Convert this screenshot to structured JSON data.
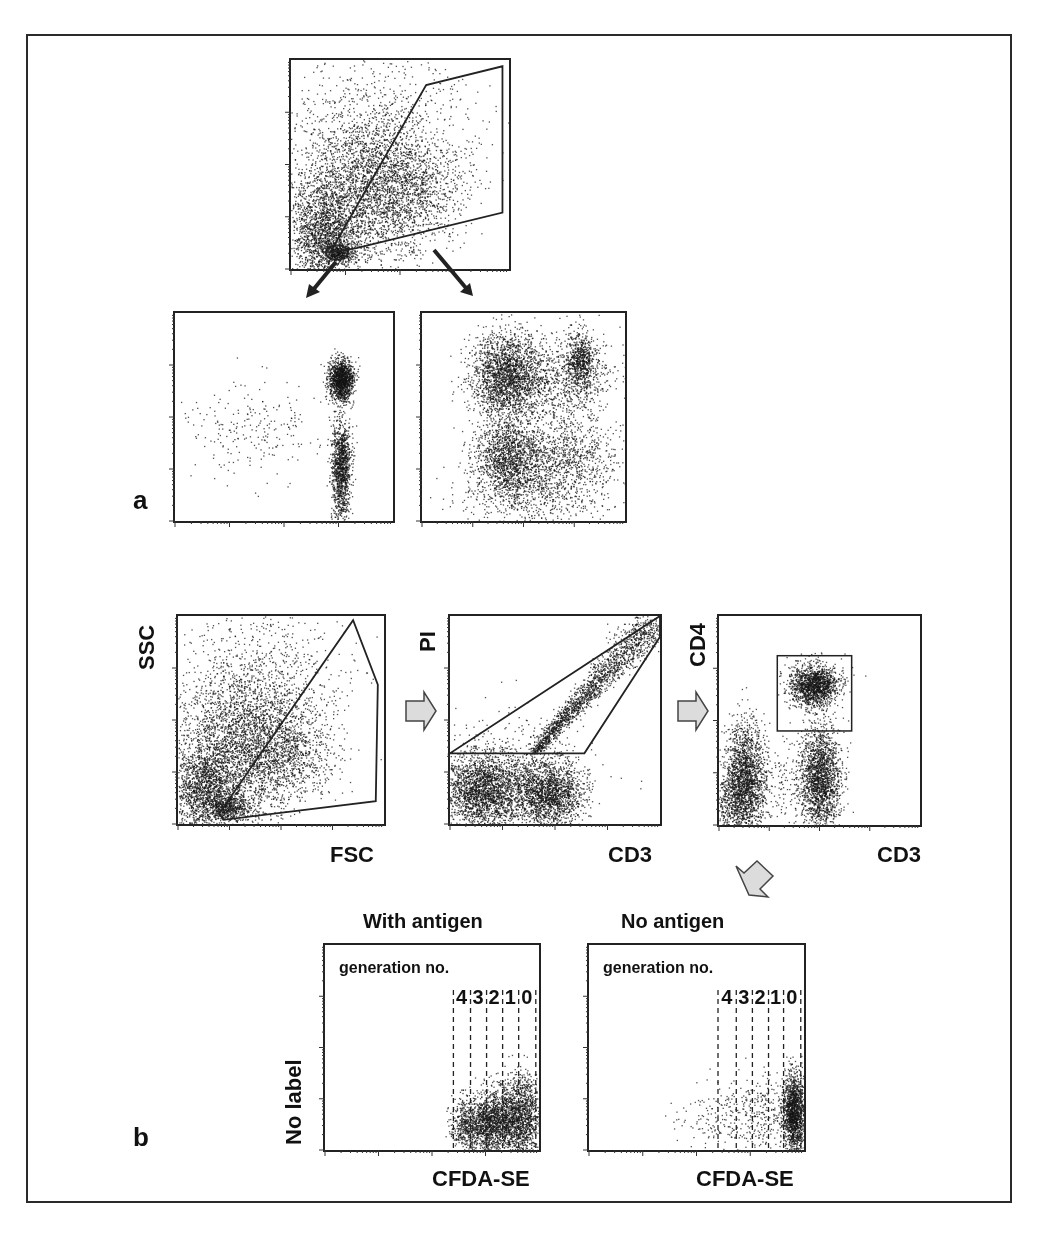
{
  "figure": {
    "panel_a_label": "a",
    "panel_b_label": "b"
  },
  "plots": {
    "top": {
      "box": [
        289,
        58,
        222,
        213
      ],
      "gate": [
        [
          0.18,
          0.92
        ],
        [
          0.62,
          0.12
        ],
        [
          0.97,
          0.03
        ],
        [
          0.97,
          0.73
        ],
        [
          0.3,
          0.9
        ]
      ],
      "small_gate_ellipse": [
        0.21,
        0.92,
        0.05,
        0.035
      ],
      "clusters": [
        {
          "cx": 0.32,
          "cy": 0.62,
          "sx": 0.16,
          "sy": 0.2,
          "n": 2600
        },
        {
          "cx": 0.14,
          "cy": 0.82,
          "sx": 0.07,
          "sy": 0.12,
          "n": 1400
        },
        {
          "cx": 0.21,
          "cy": 0.92,
          "sx": 0.04,
          "sy": 0.025,
          "n": 450
        },
        {
          "cx": 0.55,
          "cy": 0.62,
          "sx": 0.13,
          "sy": 0.12,
          "n": 900
        },
        {
          "cx": 0.45,
          "cy": 0.35,
          "sx": 0.22,
          "sy": 0.2,
          "n": 700
        }
      ]
    },
    "a_left": {
      "box": [
        173,
        311,
        222,
        212
      ],
      "clusters": [
        {
          "cx": 0.76,
          "cy": 0.32,
          "sx": 0.028,
          "sy": 0.05,
          "n": 1300
        },
        {
          "cx": 0.76,
          "cy": 0.73,
          "sx": 0.022,
          "sy": 0.11,
          "n": 1100
        },
        {
          "cx": 0.35,
          "cy": 0.55,
          "sx": 0.16,
          "sy": 0.12,
          "n": 230
        },
        {
          "cx": 0.76,
          "cy": 0.92,
          "sx": 0.02,
          "sy": 0.05,
          "n": 80
        }
      ]
    },
    "a_right": {
      "box": [
        420,
        311,
        207,
        212
      ],
      "clusters": [
        {
          "cx": 0.42,
          "cy": 0.3,
          "sx": 0.09,
          "sy": 0.1,
          "n": 2200
        },
        {
          "cx": 0.42,
          "cy": 0.7,
          "sx": 0.08,
          "sy": 0.1,
          "n": 1500
        },
        {
          "cx": 0.7,
          "cy": 0.32,
          "sx": 0.12,
          "sy": 0.1,
          "n": 700
        },
        {
          "cx": 0.78,
          "cy": 0.22,
          "sx": 0.035,
          "sy": 0.07,
          "n": 600
        },
        {
          "cx": 0.7,
          "cy": 0.68,
          "sx": 0.12,
          "sy": 0.1,
          "n": 900
        },
        {
          "cx": 0.58,
          "cy": 0.88,
          "sx": 0.2,
          "sy": 0.08,
          "n": 500
        }
      ]
    },
    "b_scatter": {
      "box": [
        176,
        614,
        210,
        212
      ],
      "y_label": "SSC",
      "x_label": "FSC",
      "gate": [
        [
          0.2,
          0.95
        ],
        [
          0.85,
          0.02
        ],
        [
          0.97,
          0.33
        ],
        [
          0.96,
          0.89
        ],
        [
          0.22,
          0.98
        ]
      ],
      "clusters": [
        {
          "cx": 0.3,
          "cy": 0.62,
          "sx": 0.15,
          "sy": 0.19,
          "n": 2600
        },
        {
          "cx": 0.12,
          "cy": 0.83,
          "sx": 0.07,
          "sy": 0.11,
          "n": 1400
        },
        {
          "cx": 0.25,
          "cy": 0.92,
          "sx": 0.05,
          "sy": 0.03,
          "n": 500
        },
        {
          "cx": 0.52,
          "cy": 0.65,
          "sx": 0.13,
          "sy": 0.11,
          "n": 900
        },
        {
          "cx": 0.42,
          "cy": 0.32,
          "sx": 0.2,
          "sy": 0.19,
          "n": 700
        }
      ]
    },
    "b_pi": {
      "box": [
        448,
        614,
        214,
        212
      ],
      "y_label": "PI",
      "x_label": "CD3",
      "gate": [
        [
          0.0,
          0.66
        ],
        [
          0.64,
          0.66
        ],
        [
          1.0,
          0.1
        ],
        [
          1.0,
          0.0
        ]
      ],
      "clusters": [
        {
          "cx": 0.15,
          "cy": 0.84,
          "sx": 0.1,
          "sy": 0.09,
          "n": 2200
        },
        {
          "cx": 0.47,
          "cy": 0.85,
          "sx": 0.08,
          "sy": 0.08,
          "n": 1700
        },
        {
          "cx": 0.3,
          "cy": 0.78,
          "sx": 0.17,
          "sy": 0.14,
          "n": 700
        },
        {
          "diag": true,
          "x0": 0.4,
          "y0": 0.65,
          "x1": 0.97,
          "y1": 0.02,
          "w": 0.04,
          "n": 1800
        }
      ]
    },
    "b_cd4": {
      "box": [
        717,
        614,
        205,
        213
      ],
      "y_label": "CD4",
      "x_label": "CD3",
      "gate_rect": [
        0.29,
        0.19,
        0.66,
        0.55
      ],
      "clusters": [
        {
          "cx": 0.47,
          "cy": 0.33,
          "sx": 0.06,
          "sy": 0.05,
          "n": 1500
        },
        {
          "cx": 0.13,
          "cy": 0.78,
          "sx": 0.05,
          "sy": 0.13,
          "n": 1900
        },
        {
          "cx": 0.5,
          "cy": 0.78,
          "sx": 0.05,
          "sy": 0.13,
          "n": 1900
        },
        {
          "cx": 0.3,
          "cy": 0.8,
          "sx": 0.09,
          "sy": 0.09,
          "n": 150
        },
        {
          "cx": 0.04,
          "cy": 0.88,
          "sx": 0.04,
          "sy": 0.08,
          "n": 300
        }
      ]
    },
    "with_antigen": {
      "box": [
        323,
        943,
        218,
        209
      ],
      "title": "With antigen",
      "inner_label": "generation no.",
      "x_label": "CFDA-SE",
      "y_label": "No label",
      "divider_x": [
        0.6,
        0.68,
        0.755,
        0.83,
        0.905,
        0.985
      ],
      "generations": [
        "4",
        "3",
        "2",
        "1",
        "0"
      ],
      "clusters": [
        {
          "cx": 0.71,
          "cy": 0.87,
          "sx": 0.05,
          "sy": 0.07,
          "n": 700
        },
        {
          "cx": 0.79,
          "cy": 0.86,
          "sx": 0.04,
          "sy": 0.08,
          "n": 800
        },
        {
          "cx": 0.87,
          "cy": 0.84,
          "sx": 0.04,
          "sy": 0.09,
          "n": 800
        },
        {
          "cx": 0.94,
          "cy": 0.83,
          "sx": 0.035,
          "sy": 0.1,
          "n": 700
        },
        {
          "cx": 0.64,
          "cy": 0.88,
          "sx": 0.03,
          "sy": 0.06,
          "n": 200
        }
      ]
    },
    "no_antigen": {
      "box": [
        587,
        943,
        219,
        209
      ],
      "title": "No antigen",
      "inner_label": "generation no.",
      "x_label": "CFDA-SE",
      "divider_x": [
        0.6,
        0.685,
        0.76,
        0.835,
        0.905,
        0.985
      ],
      "generations": [
        "4",
        "3",
        "2",
        "1",
        "0"
      ],
      "clusters": [
        {
          "cx": 0.95,
          "cy": 0.82,
          "sx": 0.025,
          "sy": 0.1,
          "n": 1500
        },
        {
          "cx": 0.8,
          "cy": 0.82,
          "sx": 0.07,
          "sy": 0.09,
          "n": 250
        },
        {
          "cx": 0.58,
          "cy": 0.84,
          "sx": 0.1,
          "sy": 0.08,
          "n": 160
        }
      ]
    }
  }
}
